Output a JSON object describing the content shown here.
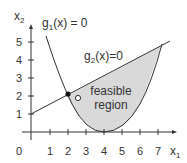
{
  "diagram": {
    "type": "feasible-region-plot",
    "axes": {
      "x_label": "x",
      "x_sub": "1",
      "y_label": "x",
      "y_sub": "2",
      "origin_label": "0",
      "x_ticks": [
        "1",
        "2",
        "3",
        "4",
        "5",
        "6",
        "7"
      ],
      "y_ticks": [
        "1",
        "2",
        "3",
        "4",
        "5"
      ]
    },
    "curves": [
      {
        "name": "g1",
        "label_main": "g",
        "label_sub": "1",
        "label_rest": "(x) = 0"
      },
      {
        "name": "g2",
        "label_main": "g",
        "label_sub": "2",
        "label_rest": "(x)=0"
      }
    ],
    "region": {
      "line1": "feasible",
      "line2": "region"
    },
    "points": [
      {
        "type": "filled",
        "x": 2,
        "y": 2
      },
      {
        "type": "open",
        "x": 2.5,
        "y": 1.8
      }
    ],
    "colors": {
      "region_fill": "#d9d9d9",
      "line": "#333333",
      "text": "#333333"
    }
  }
}
